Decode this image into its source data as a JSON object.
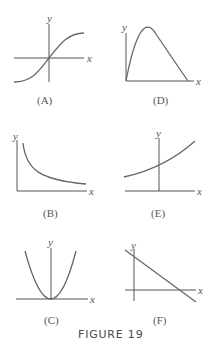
{
  "figure": {
    "caption": "FIGURE 19",
    "panels": [
      {
        "id": "A",
        "label": "(A)",
        "x_axis_label": "x",
        "y_axis_label": "y",
        "curve": "s-shaped increasing curve through origin, leveling off at both ends"
      },
      {
        "id": "D",
        "label": "(D)",
        "x_axis_label": "x",
        "y_axis_label": "y",
        "curve": "downward-opening arch starting at origin, returning to x-axis"
      },
      {
        "id": "B",
        "label": "(B)",
        "x_axis_label": "x",
        "y_axis_label": "y",
        "curve": "decreasing curve approaching x-axis, steep near y-axis"
      },
      {
        "id": "E",
        "label": "(E)",
        "x_axis_label": "x",
        "y_axis_label": "y",
        "curve": "increasing exponential-like curve crossing positive y-axis"
      },
      {
        "id": "C",
        "label": "(C)",
        "x_axis_label": "x",
        "y_axis_label": "y",
        "curve": "upward-opening parabola with vertex at origin"
      },
      {
        "id": "F",
        "label": "(F)",
        "x_axis_label": "x",
        "y_axis_label": "y",
        "curve": "straight line with negative slope crossing both axes"
      }
    ]
  }
}
